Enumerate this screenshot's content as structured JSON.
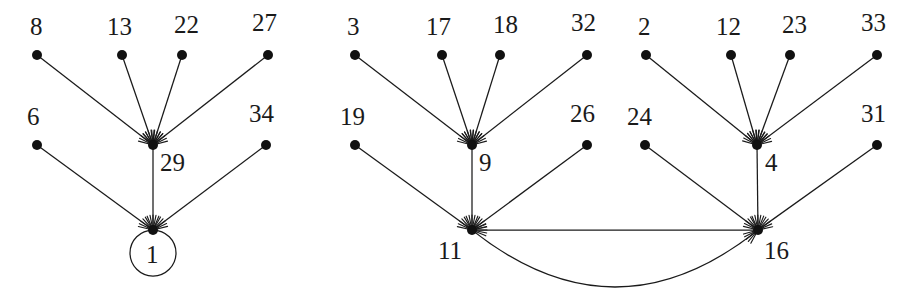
{
  "figure": {
    "type": "directed-graph",
    "background_color": "#ffffff",
    "node_color": "#111111",
    "edge_color": "#1a1a1a",
    "label_color": "#1a1a1a",
    "node_radius": 5,
    "width": 916,
    "height": 304
  },
  "nodes": [
    {
      "id": "n8",
      "label": "8",
      "x": 37,
      "y": 55,
      "label_x": 30,
      "label_y": 14,
      "component": 1
    },
    {
      "id": "n13",
      "label": "13",
      "x": 122,
      "y": 55,
      "label_x": 107,
      "label_y": 14,
      "component": 1
    },
    {
      "id": "n22",
      "label": "22",
      "x": 182,
      "y": 55,
      "label_x": 174,
      "label_y": 12,
      "component": 1
    },
    {
      "id": "n27",
      "label": "27",
      "x": 268,
      "y": 55,
      "label_x": 252,
      "label_y": 10,
      "component": 1
    },
    {
      "id": "n6",
      "label": "6",
      "x": 37,
      "y": 145,
      "label_x": 27,
      "label_y": 104,
      "component": 1
    },
    {
      "id": "n34",
      "label": "34",
      "x": 266,
      "y": 145,
      "label_x": 249,
      "label_y": 101,
      "component": 1
    },
    {
      "id": "n29",
      "label": "29",
      "x": 153,
      "y": 145,
      "label_x": 160,
      "label_y": 150,
      "component": 1
    },
    {
      "id": "n1",
      "label": "1",
      "x": 153,
      "y": 230,
      "label_x": 146,
      "label_y": 242,
      "component": 1
    },
    {
      "id": "n3",
      "label": "3",
      "x": 355,
      "y": 55,
      "label_x": 347,
      "label_y": 14,
      "component": 2
    },
    {
      "id": "n17",
      "label": "17",
      "x": 442,
      "y": 55,
      "label_x": 426,
      "label_y": 14,
      "component": 2
    },
    {
      "id": "n18",
      "label": "18",
      "x": 500,
      "y": 55,
      "label_x": 493,
      "label_y": 12,
      "component": 2
    },
    {
      "id": "n32",
      "label": "32",
      "x": 587,
      "y": 55,
      "label_x": 571,
      "label_y": 10,
      "component": 2
    },
    {
      "id": "n19",
      "label": "19",
      "x": 355,
      "y": 145,
      "label_x": 340,
      "label_y": 104,
      "component": 2
    },
    {
      "id": "n26",
      "label": "26",
      "x": 587,
      "y": 145,
      "label_x": 570,
      "label_y": 101,
      "component": 2
    },
    {
      "id": "n9",
      "label": "9",
      "x": 472,
      "y": 145,
      "label_x": 479,
      "label_y": 150,
      "component": 2
    },
    {
      "id": "n11",
      "label": "11",
      "x": 472,
      "y": 230,
      "label_x": 438,
      "label_y": 238,
      "component": 2
    },
    {
      "id": "n2",
      "label": "2",
      "x": 646,
      "y": 55,
      "label_x": 638,
      "label_y": 14,
      "component": 3
    },
    {
      "id": "n12",
      "label": "12",
      "x": 731,
      "y": 55,
      "label_x": 716,
      "label_y": 14,
      "component": 3
    },
    {
      "id": "n23",
      "label": "23",
      "x": 790,
      "y": 55,
      "label_x": 782,
      "label_y": 12,
      "component": 3
    },
    {
      "id": "n33",
      "label": "33",
      "x": 877,
      "y": 55,
      "label_x": 861,
      "label_y": 10,
      "component": 3
    },
    {
      "id": "n24",
      "label": "24",
      "x": 645,
      "y": 145,
      "label_x": 627,
      "label_y": 104,
      "component": 3
    },
    {
      "id": "n31",
      "label": "31",
      "x": 877,
      "y": 145,
      "label_x": 861,
      "label_y": 101,
      "component": 3
    },
    {
      "id": "n4",
      "label": "4",
      "x": 757,
      "y": 145,
      "label_x": 765,
      "label_y": 150,
      "component": 3
    },
    {
      "id": "n16",
      "label": "16",
      "x": 758,
      "y": 230,
      "label_x": 764,
      "label_y": 238,
      "component": 3
    }
  ],
  "edges": [
    {
      "from": "n8",
      "to": "n29",
      "kind": "straight"
    },
    {
      "from": "n13",
      "to": "n29",
      "kind": "straight"
    },
    {
      "from": "n22",
      "to": "n29",
      "kind": "straight"
    },
    {
      "from": "n27",
      "to": "n29",
      "kind": "straight"
    },
    {
      "from": "n29",
      "to": "n1",
      "kind": "straight"
    },
    {
      "from": "n6",
      "to": "n1",
      "kind": "straight"
    },
    {
      "from": "n34",
      "to": "n1",
      "kind": "straight"
    },
    {
      "from": "n3",
      "to": "n9",
      "kind": "straight"
    },
    {
      "from": "n17",
      "to": "n9",
      "kind": "straight"
    },
    {
      "from": "n18",
      "to": "n9",
      "kind": "straight"
    },
    {
      "from": "n32",
      "to": "n9",
      "kind": "straight"
    },
    {
      "from": "n9",
      "to": "n11",
      "kind": "straight"
    },
    {
      "from": "n19",
      "to": "n11",
      "kind": "straight"
    },
    {
      "from": "n26",
      "to": "n11",
      "kind": "straight"
    },
    {
      "from": "n2",
      "to": "n4",
      "kind": "straight"
    },
    {
      "from": "n12",
      "to": "n4",
      "kind": "straight"
    },
    {
      "from": "n23",
      "to": "n4",
      "kind": "straight"
    },
    {
      "from": "n33",
      "to": "n4",
      "kind": "straight"
    },
    {
      "from": "n4",
      "to": "n16",
      "kind": "straight"
    },
    {
      "from": "n24",
      "to": "n16",
      "kind": "straight"
    },
    {
      "from": "n31",
      "to": "n16",
      "kind": "straight"
    },
    {
      "from": "n16",
      "to": "n11",
      "kind": "straight"
    },
    {
      "from": "n11",
      "to": "n16",
      "kind": "curved",
      "sag": 57
    }
  ],
  "self_loops": [
    {
      "node": "n1",
      "cx": 153,
      "cy": 253,
      "r": 23
    }
  ]
}
